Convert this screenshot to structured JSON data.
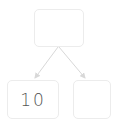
{
  "tree": {
    "root": {
      "value": ""
    },
    "left": {
      "value": "10"
    },
    "right": {
      "value": ""
    }
  },
  "colors": {
    "node_border": "#ececec",
    "edge": "#d8d8d8",
    "text": "#555555"
  }
}
